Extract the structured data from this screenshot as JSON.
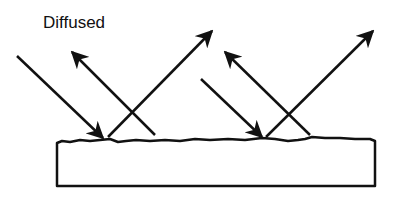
{
  "diagram": {
    "title": "Diffused",
    "colors": {
      "stroke": "#111111",
      "background": "#ffffff"
    },
    "surface": {
      "x": 57,
      "y": 140,
      "width": 318,
      "height": 46,
      "rough_top": true
    },
    "rays": [
      {
        "role": "incident",
        "from": [
          17,
          56
        ],
        "to": [
          103,
          138
        ]
      },
      {
        "role": "reflected",
        "from": [
          155,
          135
        ],
        "to": [
          72,
          52
        ]
      },
      {
        "role": "reflected",
        "from": [
          108,
          137
        ],
        "to": [
          212,
          31
        ]
      },
      {
        "role": "incident",
        "from": [
          201,
          79
        ],
        "to": [
          262,
          137
        ]
      },
      {
        "role": "reflected",
        "from": [
          310,
          135
        ],
        "to": [
          225,
          52
        ]
      },
      {
        "role": "reflected",
        "from": [
          266,
          137
        ],
        "to": [
          373,
          31
        ]
      }
    ]
  }
}
